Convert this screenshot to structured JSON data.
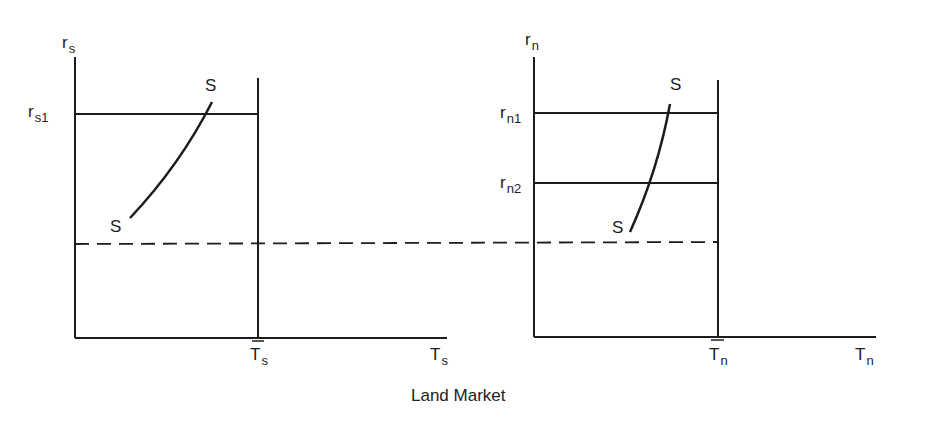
{
  "figure": {
    "title": "Land Market",
    "colors": {
      "ink": "#1c1c1c",
      "background": "#ffffff"
    }
  },
  "left_panel": {
    "y_axis": {
      "base": "r",
      "sub": "s"
    },
    "x_axis": {
      "base": "T",
      "sub": "s"
    },
    "fixed_supply": {
      "base": "T",
      "sub": "s",
      "bar": true
    },
    "price_levels": [
      {
        "base": "r",
        "sub": "s1"
      }
    ],
    "curve": {
      "top_label": "S",
      "bottom_label": "S"
    }
  },
  "right_panel": {
    "y_axis": {
      "base": "r",
      "sub": "n"
    },
    "x_axis": {
      "base": "T",
      "sub": "n"
    },
    "fixed_supply": {
      "base": "T",
      "sub": "n",
      "bar": true
    },
    "price_levels": [
      {
        "base": "r",
        "sub": "n1"
      },
      {
        "base": "r",
        "sub": "n2"
      }
    ],
    "curve": {
      "top_label": "S",
      "bottom_label": "S"
    }
  }
}
